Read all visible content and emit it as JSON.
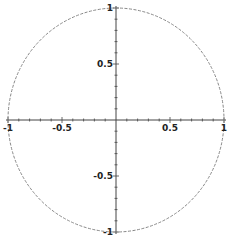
{
  "chart_data": {
    "type": "line",
    "title": "",
    "xlabel": "",
    "ylabel": "",
    "xlim": [
      -1,
      1
    ],
    "ylim": [
      -1,
      1
    ],
    "grid": false,
    "series": [
      {
        "name": "unit circle",
        "equation": "x^2 + y^2 = 1",
        "style": "dashed",
        "color": "#888888"
      }
    ],
    "x_ticks": [
      {
        "value": -1,
        "label": "-1"
      },
      {
        "value": -0.5,
        "label": "-0.5"
      },
      {
        "value": 0.5,
        "label": "0.5"
      },
      {
        "value": 1,
        "label": "1"
      }
    ],
    "y_ticks": [
      {
        "value": 1,
        "label": "1"
      },
      {
        "value": 0.5,
        "label": "0.5"
      },
      {
        "value": -0.5,
        "label": "-0.5"
      },
      {
        "value": -1,
        "label": "-1"
      }
    ]
  },
  "colors": {
    "axis": "#444444",
    "curve": "#888888"
  }
}
